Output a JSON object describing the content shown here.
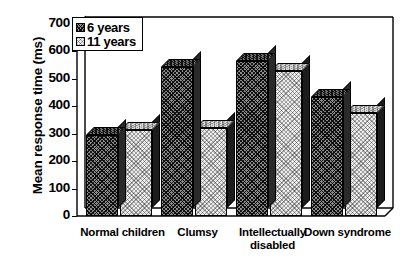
{
  "chart_data": {
    "type": "bar",
    "title": "",
    "xlabel": "",
    "ylabel": "Mean response time (ms)",
    "categories": [
      "Normal children",
      "Clumsy",
      "Intellectually disabled",
      "Down syndrome"
    ],
    "series": [
      {
        "name": "6 years",
        "values": [
          295,
          545,
          565,
          435
        ]
      },
      {
        "name": "11 years",
        "values": [
          315,
          320,
          530,
          375
        ]
      }
    ],
    "ylim": [
      0,
      700
    ],
    "yticks": [
      0,
      100,
      200,
      300,
      400,
      500,
      600,
      700
    ],
    "ytick_labels": [
      "0",
      "100",
      "200",
      "300",
      "400",
      "500",
      "600",
      "700"
    ],
    "grid": false,
    "legend_position": "top-left",
    "style": "3d-bar",
    "colors": {
      "series_6_years": "#8a8a8a",
      "series_11_years": "#ebebeb",
      "axis": "#000000",
      "background": "#ffffff"
    }
  },
  "legend": {
    "entries": [
      {
        "label": "6 years"
      },
      {
        "label": "11 years"
      }
    ]
  },
  "axis": {
    "y_title": "Mean response time (ms)"
  },
  "category_labels": [
    {
      "line1": "Normal children",
      "line2": ""
    },
    {
      "line1": "Clumsy",
      "line2": ""
    },
    {
      "line1": "Intellectually",
      "line2": "disabled"
    },
    {
      "line1": "Down syndrome",
      "line2": ""
    }
  ]
}
